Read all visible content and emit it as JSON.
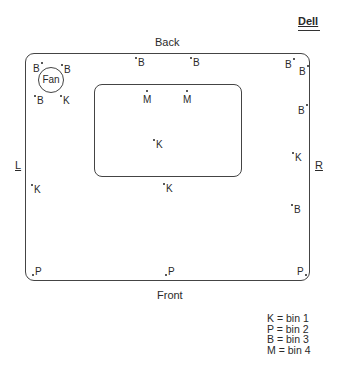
{
  "brand": "Dell",
  "sides": {
    "top": "Back",
    "bottom": "Front",
    "left": "L",
    "right": "R"
  },
  "fan_label": "Fan",
  "markers": [
    {
      "code": "B",
      "x": 33,
      "y": 63,
      "dot": "after"
    },
    {
      "code": "B",
      "x": 64,
      "y": 64,
      "dot": "before"
    },
    {
      "code": "B",
      "x": 37,
      "y": 95,
      "dot": "before"
    },
    {
      "code": "K",
      "x": 63,
      "y": 95,
      "dot": "before"
    },
    {
      "code": "B",
      "x": 138,
      "y": 57,
      "dot": "before"
    },
    {
      "code": "B",
      "x": 193,
      "y": 57,
      "dot": "before"
    },
    {
      "code": "B",
      "x": 285,
      "y": 59,
      "dot": "after"
    },
    {
      "code": "B",
      "x": 299,
      "y": 66,
      "dot": "after"
    },
    {
      "code": "B",
      "x": 298,
      "y": 105,
      "dot": "after"
    },
    {
      "code": "M",
      "x": 143,
      "y": 94,
      "dot": "above"
    },
    {
      "code": "M",
      "x": 183,
      "y": 94,
      "dot": "above"
    },
    {
      "code": "K",
      "x": 156,
      "y": 139,
      "dot": "before"
    },
    {
      "code": "K",
      "x": 166,
      "y": 183,
      "dot": "before"
    },
    {
      "code": "K",
      "x": 34,
      "y": 184,
      "dot": "before"
    },
    {
      "code": "K",
      "x": 295,
      "y": 152,
      "dot": "before"
    },
    {
      "code": "B",
      "x": 294,
      "y": 204,
      "dot": "before"
    },
    {
      "code": "P",
      "x": 35,
      "y": 266,
      "dot": "before-low"
    },
    {
      "code": "P",
      "x": 168,
      "y": 266,
      "dot": "before-low"
    },
    {
      "code": "P",
      "x": 297,
      "y": 266,
      "dot": "after-low"
    }
  ],
  "legend": [
    {
      "code": "K",
      "text": "K  = bin 1"
    },
    {
      "code": "P",
      "text": "P  = bin 2"
    },
    {
      "code": "B",
      "text": "B  = bin 3"
    },
    {
      "code": "M",
      "text": "M = bin 4"
    }
  ]
}
